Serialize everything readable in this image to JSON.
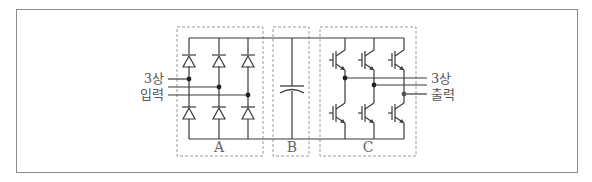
{
  "diagram": {
    "input_label": {
      "line1": "3상",
      "line2": "입력"
    },
    "output_label": {
      "line1": "3상",
      "line2": "출력"
    },
    "blocks": [
      {
        "id": "A",
        "label": "A",
        "component": "diode bridge rectifier (6 diodes)"
      },
      {
        "id": "B",
        "label": "B",
        "component": "DC link capacitor"
      },
      {
        "id": "C",
        "label": "C",
        "component": "IGBT inverter (6 IGBTs)"
      }
    ],
    "colors": {
      "line": "#3a3a3a",
      "dashed_box": "#9a9a9a",
      "frame": "#8a8a8a",
      "text": "#555555"
    }
  }
}
